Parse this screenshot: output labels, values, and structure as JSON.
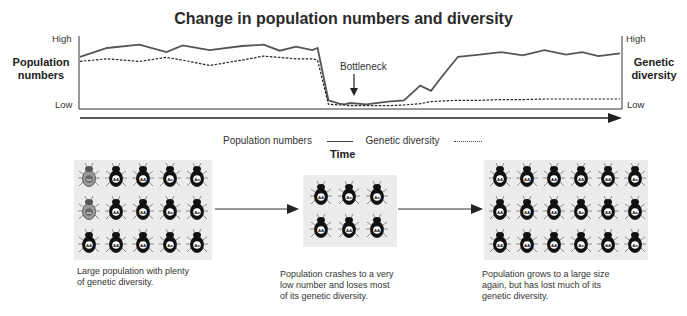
{
  "title": "Change in population numbers and diversity",
  "chart": {
    "left_axis": {
      "label": "Population numbers",
      "high": "High",
      "low": "Low"
    },
    "right_axis": {
      "label": "Genetic diversity",
      "high": "High",
      "low": "Low"
    },
    "x_axis_label": "Time",
    "annotation": "Bottleneck",
    "legend": [
      {
        "label": "Population numbers",
        "style": "solid"
      },
      {
        "label": "Genetic diversity",
        "style": "dotted"
      }
    ],
    "colors": {
      "population_line": "#555555",
      "diversity_line": "#222222",
      "axis": "#333333"
    }
  },
  "chart_data": {
    "type": "line",
    "title": "Change in population numbers and diversity",
    "xlabel": "Time",
    "ylabel": "Population numbers",
    "y2label": "Genetic diversity",
    "ylim": [
      "Low",
      "High"
    ],
    "grid": false,
    "legend_position": "bottom",
    "annotations": [
      {
        "text": "Bottleneck",
        "x": 0.42
      }
    ],
    "x": [
      0,
      0.05,
      0.11,
      0.16,
      0.19,
      0.24,
      0.3,
      0.34,
      0.37,
      0.4,
      0.43,
      0.44,
      0.46,
      0.48,
      0.49,
      0.5,
      0.53,
      0.57,
      0.6,
      0.63,
      0.65,
      0.67,
      0.7,
      0.74,
      0.78,
      0.82,
      0.86,
      0.9,
      0.93,
      0.96,
      1.0
    ],
    "series": [
      {
        "name": "Population numbers",
        "style": "solid",
        "values": [
          0.75,
          0.88,
          0.93,
          0.82,
          0.92,
          0.85,
          0.91,
          0.93,
          0.84,
          0.9,
          0.85,
          0.88,
          0.1,
          0.05,
          0.04,
          0.06,
          0.04,
          0.08,
          0.1,
          0.32,
          0.24,
          0.45,
          0.75,
          0.78,
          0.82,
          0.77,
          0.85,
          0.78,
          0.82,
          0.76,
          0.8
        ]
      },
      {
        "name": "Genetic diversity",
        "style": "dotted",
        "values": [
          0.68,
          0.72,
          0.68,
          0.74,
          0.7,
          0.62,
          0.7,
          0.76,
          0.74,
          0.72,
          0.72,
          0.7,
          0.04,
          0.03,
          0.03,
          0.02,
          0.02,
          0.02,
          0.03,
          0.05,
          0.08,
          0.09,
          0.1,
          0.1,
          0.11,
          0.11,
          0.12,
          0.12,
          0.12,
          0.12,
          0.12
        ]
      }
    ]
  },
  "panels": [
    {
      "name": "before",
      "rows": [
        [
          "aa",
          "AA",
          "AA",
          "Aa",
          "Aa"
        ],
        [
          "aa",
          "AA",
          "AA",
          "Aa",
          "Aa"
        ],
        [
          "AA",
          "AA",
          "AA",
          "Aa",
          "Aa"
        ]
      ],
      "caption": [
        "Large population with plenty",
        "of genetic diversity."
      ]
    },
    {
      "name": "bottleneck",
      "rows": [
        [
          "AA",
          "Aa",
          "Aa"
        ],
        [
          "AA",
          "AA",
          "AA"
        ]
      ],
      "caption": [
        "Population crashes to a very",
        "low number and loses most",
        "of its genetic diversity."
      ]
    },
    {
      "name": "after",
      "rows": [
        [
          "AA",
          "AA",
          "AA",
          "AA",
          "AA",
          "Aa"
        ],
        [
          "AA",
          "AA",
          "AA",
          "Aa",
          "AA",
          "Aa"
        ],
        [
          "AA",
          "AA",
          "AA",
          "Aa",
          "AA",
          "Aa"
        ]
      ],
      "caption": [
        "Population grows to a large size",
        "again, but has lost much of its",
        "genetic diversity."
      ]
    }
  ]
}
